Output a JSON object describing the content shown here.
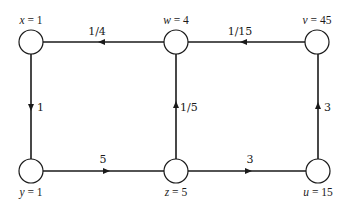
{
  "diagram": {
    "type": "directed-graph",
    "colors": {
      "stroke": "#1a1a1a",
      "background": "#ffffff",
      "node_fill": "#ffffff"
    },
    "nodes": [
      {
        "id": "x",
        "var": "x",
        "eq": " = 1",
        "value": 1,
        "cx": 31,
        "cy": 42,
        "label_pos": "above"
      },
      {
        "id": "w",
        "var": "w",
        "eq": " = 4",
        "value": 4,
        "cx": 176,
        "cy": 42,
        "label_pos": "above"
      },
      {
        "id": "v",
        "var": "v",
        "eq": " = 45",
        "value": 45,
        "cx": 317,
        "cy": 42,
        "label_pos": "above"
      },
      {
        "id": "y",
        "var": "y",
        "eq": " = 1",
        "value": 1,
        "cx": 31,
        "cy": 171,
        "label_pos": "below"
      },
      {
        "id": "z",
        "var": "z",
        "eq": " = 5",
        "value": 5,
        "cx": 176,
        "cy": 171,
        "label_pos": "below"
      },
      {
        "id": "u",
        "var": "u",
        "eq": " = 15",
        "value": 15,
        "cx": 318,
        "cy": 171,
        "label_pos": "below"
      }
    ],
    "edges": [
      {
        "from": "w",
        "to": "x",
        "label": "1/4"
      },
      {
        "from": "v",
        "to": "w",
        "label": "1/15"
      },
      {
        "from": "x",
        "to": "y",
        "label": "1"
      },
      {
        "from": "z",
        "to": "w",
        "label": "1/5"
      },
      {
        "from": "u",
        "to": "v",
        "label": "3"
      },
      {
        "from": "y",
        "to": "z",
        "label": "5"
      },
      {
        "from": "z",
        "to": "u",
        "label": "3"
      }
    ]
  }
}
